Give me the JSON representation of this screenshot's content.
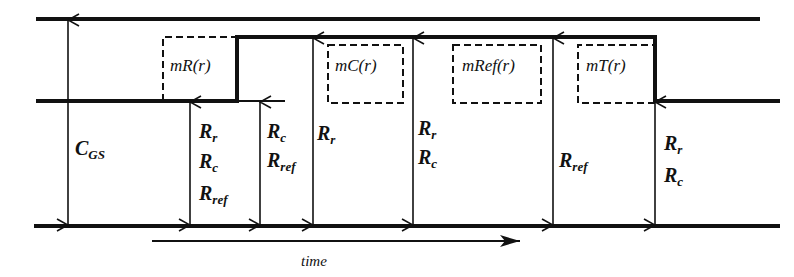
{
  "diagram": {
    "type": "timing-diagram",
    "colors": {
      "line": "#111111",
      "background": "#ffffff"
    },
    "levels": {
      "top": "upper rail",
      "middle": "signal low level",
      "bottom": "ground rail"
    },
    "boxes": [
      {
        "label": "mR(r)"
      },
      {
        "label": "mC(r)"
      },
      {
        "label": "mRef(r)"
      },
      {
        "label": "mT(r)"
      }
    ],
    "arrows": [
      {
        "id": "cgs",
        "labels": [
          {
            "main": "C",
            "sub": "GS"
          }
        ]
      },
      {
        "id": "a1",
        "labels": [
          {
            "main": "R",
            "sub": "r"
          },
          {
            "main": "R",
            "sub": "c"
          },
          {
            "main": "R",
            "sub": "ref"
          }
        ]
      },
      {
        "id": "a2",
        "labels": [
          {
            "main": "R",
            "sub": "c"
          },
          {
            "main": "R",
            "sub": "ref"
          }
        ]
      },
      {
        "id": "a3",
        "labels": [
          {
            "main": "R",
            "sub": "r"
          }
        ]
      },
      {
        "id": "a4",
        "labels": [
          {
            "main": "R",
            "sub": "r"
          },
          {
            "main": "R",
            "sub": "c"
          }
        ]
      },
      {
        "id": "a5",
        "labels": [
          {
            "main": "R",
            "sub": "ref"
          }
        ]
      },
      {
        "id": "a6",
        "labels": [
          {
            "main": "R",
            "sub": "r"
          },
          {
            "main": "R",
            "sub": "c"
          }
        ]
      }
    ],
    "time_axis": {
      "label": "time"
    }
  }
}
